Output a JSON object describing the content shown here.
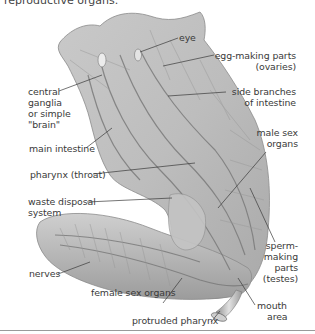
{
  "caption": "reproductive organs.",
  "labels": {
    "eye": "eye",
    "ovaries_1": "egg-making parts",
    "ovaries_2": "(ovaries)",
    "side_branches_1": "side branches",
    "side_branches_2": "of intestine",
    "ganglia_1": "central",
    "ganglia_2": "ganglia",
    "ganglia_3": "or simple",
    "ganglia_4": "\"brain\"",
    "main_intestine": "main intestine",
    "male_sex_1": "male sex",
    "male_sex_2": "organs",
    "pharynx": "pharynx (throat)",
    "waste_1": "waste disposal",
    "waste_2": "system",
    "testes_1": "sperm-",
    "testes_2": "making",
    "testes_3": "parts",
    "testes_4": "(testes)",
    "nerves": "nerves",
    "female_sex": "female sex organs",
    "mouth_1": "mouth",
    "mouth_2": "area",
    "protruded_pharynx": "protruded pharynx"
  }
}
